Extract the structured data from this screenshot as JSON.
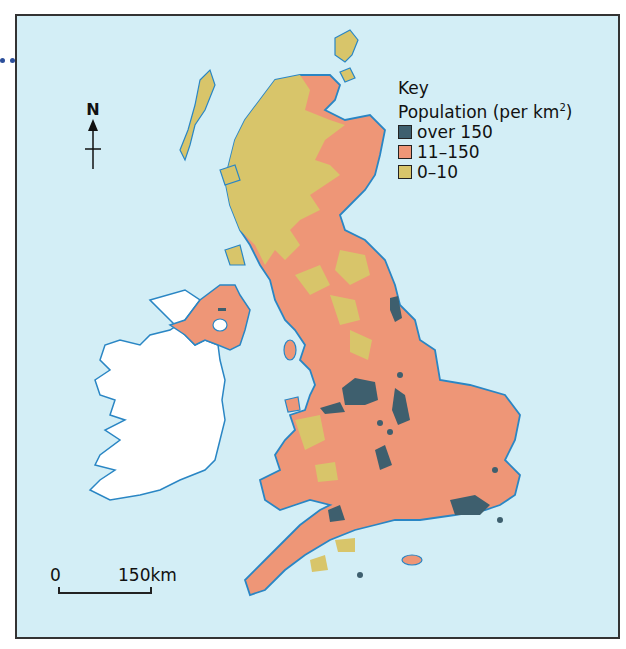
{
  "map": {
    "title": "Population density of the British Isles",
    "north_arrow_label": "N",
    "key": {
      "heading": "Key",
      "subheading": "Population (per km",
      "superscript": "2",
      "subheading_close": ")",
      "items": [
        {
          "label": "over 150",
          "color": "#3e5f6e"
        },
        {
          "label": "11–150",
          "color": "#ee9677"
        },
        {
          "label": "0–10",
          "color": "#d8c56a"
        }
      ]
    },
    "scale_bar": {
      "start": "0",
      "end": "150km"
    },
    "colors": {
      "sea": "#d3eef6",
      "coastline": "#2a86c4",
      "ireland_republic": "#ffffff",
      "high_density": "#3e5f6e",
      "medium_density": "#ee9677",
      "low_density": "#d8c56a"
    },
    "regions": [
      {
        "name": "Scotland",
        "dominant_class": "0–10"
      },
      {
        "name": "England",
        "dominant_class": "11–150"
      },
      {
        "name": "Wales",
        "dominant_class": "11–150"
      },
      {
        "name": "Northern Ireland",
        "dominant_class": "11–150"
      },
      {
        "name": "Republic of Ireland",
        "dominant_class": "not shown"
      }
    ]
  }
}
